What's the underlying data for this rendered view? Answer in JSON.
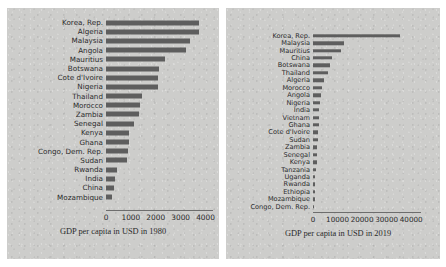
{
  "chart_data": [
    {
      "type": "bar",
      "orientation": "horizontal",
      "id": "gdp-1980",
      "title": "",
      "xlabel": "GDP per capita in USD in 1980",
      "ylabel": "",
      "xlim": [
        0,
        4300
      ],
      "xticks": [
        "0",
        "1000",
        "2000",
        "3000",
        "4000"
      ],
      "xtick_values": [
        0,
        1000,
        2000,
        3000,
        4000
      ],
      "grid": false,
      "legend": "none",
      "bar_color": "#5e5e5e",
      "categories": [
        "Korea, Rep.",
        "Algeria",
        "Malaysia",
        "Angola",
        "Mauritius",
        "Botswana",
        "Cote d'Ivoire",
        "Nigeria",
        "Thailand",
        "Morocco",
        "Zambia",
        "Senegal",
        "Kenya",
        "Ghana",
        "Congo, Dem. Rep.",
        "Sudan",
        "Rwanda",
        "India",
        "China",
        "Mozambique"
      ],
      "values": [
        3730,
        3720,
        3380,
        3200,
        2360,
        2120,
        2080,
        2070,
        1450,
        1350,
        1310,
        1120,
        930,
        910,
        880,
        840,
        430,
        380,
        330,
        250
      ]
    },
    {
      "type": "bar",
      "orientation": "horizontal",
      "id": "gdp-2019",
      "title": "",
      "xlabel": "GDP per capita in USD in 2019",
      "ylabel": "",
      "xlim": [
        0,
        44000
      ],
      "xticks": [
        "0",
        "10000",
        "20000",
        "30000",
        "40000"
      ],
      "xtick_values": [
        0,
        10000,
        20000,
        30000,
        40000
      ],
      "grid": false,
      "legend": "none",
      "bar_color": "#5e5e5e",
      "categories": [
        "Korea, Rep.",
        "Malaysia",
        "Mauritius",
        "China",
        "Botswana",
        "Thailand",
        "Algeria",
        "Morocco",
        "Angola",
        "Nigeria",
        "India",
        "Vietnam",
        "Ghana",
        "Cote d'Ivoire",
        "Sudan",
        "Zambia",
        "Senegal",
        "Kenya",
        "Tanzania",
        "Uganda",
        "Rwanda",
        "Ethiopia",
        "Mozambique",
        "Congo, Dem. Rep."
      ],
      "values": [
        31500,
        11400,
        10200,
        6900,
        6100,
        5500,
        3900,
        3300,
        2800,
        2600,
        2200,
        2100,
        2000,
        1900,
        1800,
        1600,
        1500,
        1400,
        1100,
        900,
        800,
        700,
        600,
        500
      ]
    }
  ]
}
